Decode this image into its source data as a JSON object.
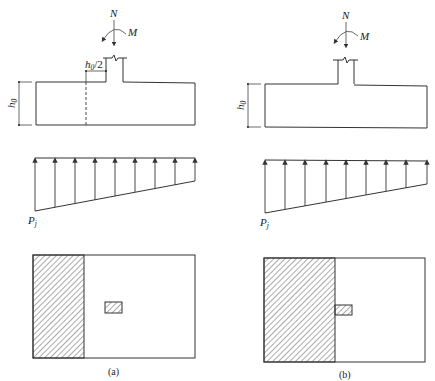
{
  "figure": {
    "colors": {
      "line": "#333333",
      "background": "#ffffff"
    },
    "panels": [
      {
        "id": "a",
        "caption": "(a)",
        "elevation": {
          "load_label": "N",
          "moment_label": "M",
          "depth_label": "h",
          "depth_subscript": "0",
          "half_depth_label": "h",
          "half_depth_subscript": "0",
          "half_depth_suffix": "/2",
          "has_dashed_section_line": true
        },
        "pressure": {
          "label": "P",
          "label_subscript": "j",
          "arrow_count": 9
        },
        "plan": {
          "hatched_region": "left strip beyond h0/2 from column face",
          "column_position": "center"
        }
      },
      {
        "id": "b",
        "caption": "(b)",
        "elevation": {
          "load_label": "N",
          "moment_label": "M",
          "depth_label": "h",
          "depth_subscript": "0",
          "has_dashed_section_line": false
        },
        "pressure": {
          "label": "P",
          "label_subscript": "j",
          "arrow_count": 9
        },
        "plan": {
          "hatched_region": "left region up to column face",
          "column_position": "at hatched edge"
        }
      }
    ]
  }
}
